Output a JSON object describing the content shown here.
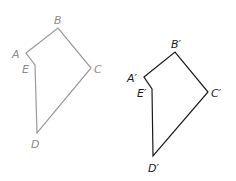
{
  "figures": [
    {
      "name": "original",
      "color": "#9a9a9a",
      "vertices": {
        "A": {
          "label": "A",
          "x": 26,
          "y": 53
        },
        "B": {
          "label": "B",
          "x": 58,
          "y": 28
        },
        "C": {
          "label": "C",
          "x": 91,
          "y": 68
        },
        "D": {
          "label": "D",
          "x": 37,
          "y": 133
        },
        "E": {
          "label": "E",
          "x": 35,
          "y": 65
        }
      }
    },
    {
      "name": "image",
      "color": "#1a1a1a",
      "vertices": {
        "A": {
          "label": "A′",
          "x": 144,
          "y": 77
        },
        "B": {
          "label": "B′",
          "x": 175,
          "y": 52
        },
        "C": {
          "label": "C′",
          "x": 208,
          "y": 92
        },
        "D": {
          "label": "D′",
          "x": 153,
          "y": 156
        },
        "E": {
          "label": "E′",
          "x": 152,
          "y": 89
        }
      }
    }
  ]
}
